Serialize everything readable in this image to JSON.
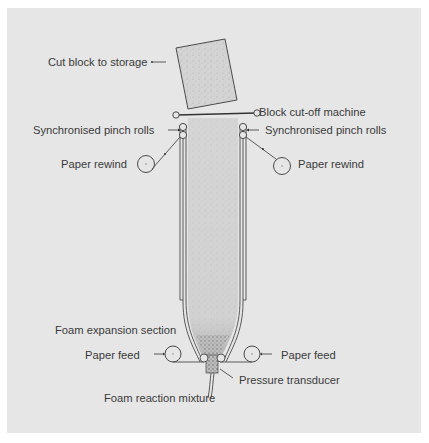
{
  "figure": {
    "background_color": "#e6e6e6",
    "line_color": "#4a4a4a",
    "foam_color": "#d2d2d2",
    "labels": {
      "cut_block": "Cut block to storage",
      "cut_off_machine": "Block cut-off machine",
      "pinch_rolls_left": "Synchronised pinch rolls",
      "pinch_rolls_right": "Synchronised pinch rolls",
      "paper_rewind_left": "Paper rewind",
      "paper_rewind_right": "Paper rewind",
      "foam_expansion": "Foam expansion section",
      "paper_feed_left": "Paper feed",
      "paper_feed_right": "Paper feed",
      "pressure_transducer": "Pressure transducer",
      "foam_mixture": "Foam reaction mixture"
    }
  }
}
